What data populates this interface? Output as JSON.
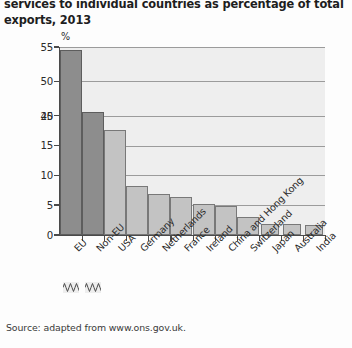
{
  "title": {
    "line1": "services to individual countries as percentage of total",
    "line2": "exports, 2013"
  },
  "source": "Source: adapted from www.ons.gov.uk.",
  "axis": {
    "unit_symbol": "%",
    "y_tick_labels": [
      "55",
      "50",
      "45",
      "20",
      "15",
      "10",
      "5",
      "0"
    ]
  },
  "colors": {
    "bar_dark": "#8d8d8d",
    "bar_light": "#c3c3c3",
    "plot_background": "#eeeeee",
    "gridline": "#9b9b9b",
    "axis": "#4a4a4a",
    "page_background": "#fdfdfd",
    "text": "#2b2b2b"
  },
  "chart_data": {
    "type": "bar",
    "title": "services to individual countries as percentage of total exports, 2013",
    "xlabel": "",
    "ylabel": "%",
    "ylim": [
      0,
      55
    ],
    "axis_break": {
      "present": true,
      "from": 20,
      "to": 45,
      "marker": "zigzag"
    },
    "grid": true,
    "gridlines_at": [
      5,
      10,
      15,
      20,
      45,
      50,
      55
    ],
    "legend": "none",
    "categories": [
      "EU",
      "Non-EU",
      "USA",
      "Germany",
      "Netherlands",
      "France",
      "Ireland",
      "China and Hong Kong",
      "Switzerland",
      "Japan",
      "Australia",
      "India"
    ],
    "values": [
      54.6,
      45.5,
      17.6,
      8.3,
      6.9,
      6.3,
      5.2,
      4.9,
      3.1,
      1.9,
      1.9,
      1.6
    ],
    "series": [
      {
        "name": "Percentage of total exports",
        "values": [
          54.6,
          45.5,
          17.6,
          8.3,
          6.9,
          6.3,
          5.2,
          4.9,
          3.1,
          1.9,
          1.9,
          1.6
        ]
      }
    ],
    "bar_shades": [
      "dark",
      "dark",
      "light",
      "light",
      "light",
      "light",
      "light",
      "light",
      "light",
      "light",
      "light",
      "light"
    ]
  }
}
